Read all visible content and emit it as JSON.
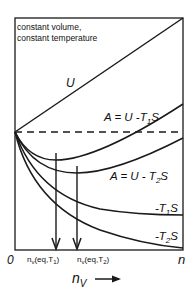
{
  "diagram": {
    "caption_line1": "constant volume,",
    "caption_line2": "constant temperature",
    "curves": {
      "U": "U",
      "A1": {
        "prefix": "A = U -T",
        "sub": "1",
        "suffix": "S"
      },
      "A2": {
        "prefix": "A = U - T",
        "sub": "2",
        "suffix": "S"
      },
      "T1S": {
        "prefix": "-T",
        "sub": "1",
        "suffix": "S"
      },
      "T2S": {
        "prefix": "-T",
        "sub": "2",
        "suffix": "S"
      }
    },
    "markers": {
      "eq1": {
        "base": "n",
        "base_sub": "v",
        "mid": "(eq,T",
        "sub": "1",
        "end": ")"
      },
      "eq2": {
        "base": "n",
        "base_sub": "v",
        "mid": "(eq,T",
        "sub": "2",
        "end": ")"
      }
    },
    "axis": {
      "origin": "0",
      "end": "n",
      "xlabel": "n",
      "xlabel_sub": "V",
      "arrow": "⟶"
    },
    "colors": {
      "line": "#1a1a1a",
      "background": "#ffffff"
    }
  }
}
